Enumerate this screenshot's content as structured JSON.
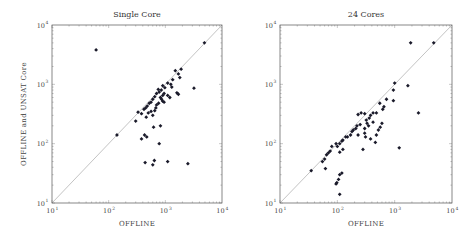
{
  "chart_data": [
    {
      "type": "scatter",
      "title": "Single Core",
      "xlabel": "Offline",
      "ylabel": "Offline and UNSAT Core",
      "xscale": "log",
      "yscale": "log",
      "xlim": [
        10,
        10000
      ],
      "ylim": [
        10,
        10000
      ],
      "xticks": [
        "10^1",
        "10^2",
        "10^3",
        "10^4"
      ],
      "yticks": [
        "10^1",
        "10^2",
        "10^3",
        "10^4"
      ],
      "diagonal": true,
      "grid": false,
      "frame": {
        "x0": 52,
        "y0": 25,
        "x1": 222,
        "y1": 203
      },
      "points": [
        [
          60,
          3800
        ],
        [
          4900,
          5000
        ],
        [
          1900,
          1800
        ],
        [
          1700,
          1500
        ],
        [
          1800,
          1300
        ],
        [
          1500,
          1700
        ],
        [
          1350,
          1200
        ],
        [
          1250,
          1000
        ],
        [
          1100,
          1050
        ],
        [
          900,
          950
        ],
        [
          850,
          800
        ],
        [
          980,
          880
        ],
        [
          750,
          820
        ],
        [
          700,
          700
        ],
        [
          650,
          620
        ],
        [
          600,
          560
        ],
        [
          560,
          500
        ],
        [
          520,
          480
        ],
        [
          480,
          430
        ],
        [
          450,
          400
        ],
        [
          420,
          380
        ],
        [
          780,
          740
        ],
        [
          820,
          600
        ],
        [
          860,
          560
        ],
        [
          900,
          520
        ],
        [
          950,
          500
        ],
        [
          760,
          480
        ],
        [
          700,
          450
        ],
        [
          680,
          400
        ],
        [
          650,
          360
        ],
        [
          1100,
          650
        ],
        [
          1200,
          600
        ],
        [
          1300,
          900
        ],
        [
          1600,
          720
        ],
        [
          1700,
          680
        ],
        [
          3200,
          860
        ],
        [
          560,
          350
        ],
        [
          600,
          300
        ],
        [
          500,
          330
        ],
        [
          330,
          340
        ],
        [
          380,
          320
        ],
        [
          300,
          240
        ],
        [
          460,
          280
        ],
        [
          380,
          120
        ],
        [
          430,
          140
        ],
        [
          470,
          130
        ],
        [
          620,
          190
        ],
        [
          820,
          200
        ],
        [
          780,
          100
        ],
        [
          140,
          140
        ],
        [
          440,
          48
        ],
        [
          600,
          44
        ],
        [
          640,
          52
        ],
        [
          1100,
          50
        ],
        [
          2500,
          46
        ],
        [
          900,
          650
        ],
        [
          950,
          700
        ]
      ]
    },
    {
      "type": "scatter",
      "title": "24 Cores",
      "xlabel": "Offline",
      "ylabel": "",
      "xscale": "log",
      "yscale": "log",
      "xlim": [
        10,
        10000
      ],
      "ylim": [
        10,
        10000
      ],
      "xticks": [
        "10^1",
        "10^2",
        "10^3",
        "10^4"
      ],
      "yticks": [
        "10^1",
        "10^2",
        "10^3",
        "10^4"
      ],
      "diagonal": true,
      "grid": false,
      "frame": {
        "x0": 280,
        "y0": 25,
        "x1": 452,
        "y1": 203
      },
      "points": [
        [
          1900,
          5000
        ],
        [
          4800,
          5000
        ],
        [
          1000,
          1050
        ],
        [
          950,
          800
        ],
        [
          1700,
          950
        ],
        [
          950,
          530
        ],
        [
          2600,
          330
        ],
        [
          1200,
          85
        ],
        [
          720,
          560
        ],
        [
          650,
          420
        ],
        [
          550,
          480
        ],
        [
          620,
          380
        ],
        [
          480,
          330
        ],
        [
          420,
          330
        ],
        [
          380,
          300
        ],
        [
          360,
          270
        ],
        [
          320,
          250
        ],
        [
          300,
          320
        ],
        [
          260,
          330
        ],
        [
          230,
          310
        ],
        [
          330,
          220
        ],
        [
          300,
          180
        ],
        [
          250,
          210
        ],
        [
          220,
          200
        ],
        [
          210,
          180
        ],
        [
          190,
          170
        ],
        [
          180,
          160
        ],
        [
          170,
          140
        ],
        [
          150,
          130
        ],
        [
          140,
          130
        ],
        [
          125,
          115
        ],
        [
          120,
          110
        ],
        [
          110,
          100
        ],
        [
          100,
          90
        ],
        [
          95,
          100
        ],
        [
          80,
          90
        ],
        [
          75,
          75
        ],
        [
          70,
          70
        ],
        [
          65,
          65
        ],
        [
          60,
          55
        ],
        [
          55,
          50
        ],
        [
          35,
          35
        ],
        [
          62,
          38
        ],
        [
          110,
          72
        ],
        [
          125,
          80
        ],
        [
          280,
          80
        ],
        [
          460,
          105
        ],
        [
          380,
          120
        ],
        [
          480,
          140
        ],
        [
          520,
          170
        ],
        [
          560,
          190
        ],
        [
          600,
          220
        ],
        [
          420,
          230
        ],
        [
          350,
          200
        ],
        [
          300,
          150
        ],
        [
          110,
          30
        ],
        [
          120,
          32
        ],
        [
          105,
          25
        ],
        [
          98,
          22
        ],
        [
          95,
          21
        ],
        [
          110,
          14
        ],
        [
          230,
          140
        ],
        [
          310,
          130
        ]
      ]
    }
  ],
  "panels": [
    {
      "title": "Single Core",
      "ylabel": "Offline and UNSAT Core",
      "xlabel": "Offline",
      "tick_base": "10",
      "tick_exps": [
        "1",
        "2",
        "3",
        "4"
      ]
    },
    {
      "title": "24 Cores",
      "ylabel": "",
      "xlabel": "Offline",
      "tick_base": "10",
      "tick_exps": [
        "1",
        "2",
        "3",
        "4"
      ]
    }
  ],
  "colors": {
    "frame": "#555555",
    "diagonal": "#9a9a9a",
    "marker": "#1a1a2a",
    "tick": "#777777"
  }
}
